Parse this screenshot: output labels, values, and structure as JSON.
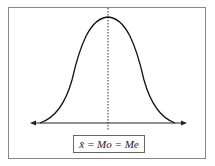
{
  "diagram": {
    "type": "normal-distribution",
    "label": "x̄ = Mo = Me",
    "center_line": "dotted vertical line at peak",
    "axis": "horizontal axis with arrows at both ends",
    "colors": {
      "stroke": "#1a1a1a",
      "frame": "#888888",
      "background": "#ffffff"
    }
  }
}
